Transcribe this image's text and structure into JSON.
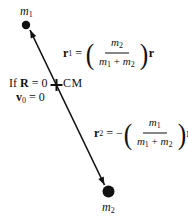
{
  "diagram": {
    "ink_color": "#111111",
    "background_color": "#ffffff",
    "mass1": {
      "base": "m",
      "sub": "1"
    },
    "mass2": {
      "base": "m",
      "sub": "2"
    },
    "cm_label": "CM",
    "condition": {
      "line1": {
        "word": "If",
        "vector": "R",
        "rel": "=",
        "value": "0"
      },
      "line2": {
        "vector": "v",
        "sub": "0",
        "rel": "=",
        "value": "0"
      }
    },
    "eq1": {
      "lhs_base": "r",
      "lhs_sub": "1",
      "rel": "=",
      "sign": "",
      "open_paren": "(",
      "close_paren": ")",
      "num_base": "m",
      "num_sub": "2",
      "den_a_base": "m",
      "den_a_sub": "1",
      "den_plus": "+",
      "den_b_base": "m",
      "den_b_sub": "2",
      "rhs": "r"
    },
    "eq2": {
      "lhs_base": "r",
      "lhs_sub": "2",
      "rel": "=",
      "sign": "−",
      "open_paren": "(",
      "close_paren": ")",
      "num_base": "m",
      "num_sub": "1",
      "den_a_base": "m",
      "den_a_sub": "1",
      "den_plus": "+",
      "den_b_base": "m",
      "den_b_sub": "2",
      "rhs": "r"
    }
  }
}
